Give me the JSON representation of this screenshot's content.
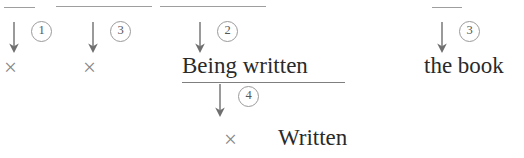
{
  "figure": {
    "type": "syntactic-derivation-diagram",
    "background_color": "#ffffff",
    "ink_color": "#2a2a2a",
    "rule_color": "#8d8d8d"
  },
  "top_rules": [
    {
      "label": "rule-segment-1"
    },
    {
      "label": "rule-segment-2"
    },
    {
      "label": "rule-segment-3"
    },
    {
      "label": "rule-segment-4"
    }
  ],
  "clipped_descenders": [
    {
      "glyph": "y"
    },
    {
      "glyph": "g"
    }
  ],
  "columns": [
    {
      "id": "col-1",
      "marker": "①",
      "marker_number": "1",
      "content": "×",
      "content_kind": "deletion-mark"
    },
    {
      "id": "col-2",
      "marker": "③",
      "marker_number": "3",
      "content": "×",
      "content_kind": "deletion-mark"
    },
    {
      "id": "col-3",
      "marker": "②",
      "marker_number": "2",
      "content": "Being written",
      "content_kind": "phrase",
      "underlined": true
    },
    {
      "id": "col-4",
      "marker": "③",
      "marker_number": "3",
      "content": "the book",
      "content_kind": "phrase",
      "underlined": false
    }
  ],
  "lower_branch": {
    "marker": "④",
    "marker_number": "4",
    "deletion_mark": "×",
    "content": "Written",
    "content_kind": "phrase"
  }
}
